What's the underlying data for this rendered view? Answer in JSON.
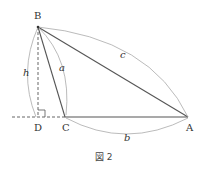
{
  "figure": {
    "caption": "図 2",
    "points": {
      "B": {
        "label": "B"
      },
      "C": {
        "label": "C"
      },
      "A": {
        "label": "A"
      },
      "D": {
        "label": "D"
      }
    },
    "sides": {
      "a": {
        "label": "a"
      },
      "b": {
        "label": "b"
      },
      "c": {
        "label": "c"
      },
      "h": {
        "label": "h"
      }
    },
    "colors": {
      "line": "#555555",
      "arc": "#aaaaaa"
    }
  }
}
